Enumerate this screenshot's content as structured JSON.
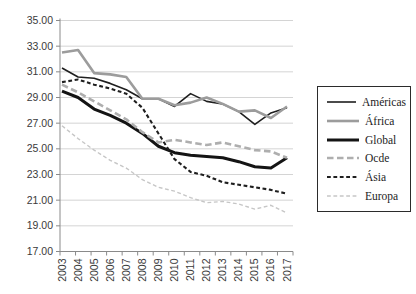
{
  "chart_data": {
    "type": "line",
    "title": "",
    "xlabel": "",
    "ylabel": "",
    "grid": "horizontal",
    "legend_position": "right",
    "ylim": [
      17,
      35
    ],
    "y_tick_step": 2,
    "y_tick_labels": [
      "35.00",
      "33.00",
      "31.00",
      "29.00",
      "27.00",
      "25.00",
      "23.00",
      "21.00",
      "19.00",
      "17.00"
    ],
    "x": [
      "2003",
      "2004",
      "2005",
      "2006",
      "2007",
      "2008",
      "2009",
      "2010",
      "2011",
      "2012",
      "2013",
      "2014",
      "2015",
      "2016",
      "2017"
    ],
    "series": [
      {
        "name": "Américas",
        "color": "#1f1f1f",
        "line": "solid",
        "width": 1.6,
        "values": [
          31.3,
          30.6,
          30.5,
          30.1,
          29.6,
          28.9,
          28.9,
          28.3,
          29.3,
          28.7,
          28.5,
          27.9,
          26.9,
          27.8,
          28.2
        ]
      },
      {
        "name": "África",
        "color": "#9c9c9c",
        "line": "solid",
        "width": 2.6,
        "values": [
          32.5,
          32.7,
          30.9,
          30.8,
          30.6,
          28.9,
          28.9,
          28.4,
          28.6,
          29.0,
          28.5,
          27.9,
          28.0,
          27.4,
          28.3
        ]
      },
      {
        "name": "Global",
        "color": "#141414",
        "line": "solid",
        "width": 3,
        "values": [
          29.5,
          29.0,
          28.1,
          27.6,
          27.0,
          26.2,
          25.2,
          24.7,
          24.5,
          24.4,
          24.3,
          24.0,
          23.6,
          23.5,
          24.3
        ]
      },
      {
        "name": "Ocde",
        "color": "#aeaeae",
        "line": "dashed-long",
        "width": 2.6,
        "values": [
          30.0,
          29.4,
          28.7,
          28.0,
          27.3,
          26.3,
          25.5,
          25.7,
          25.5,
          25.3,
          25.5,
          25.2,
          24.9,
          24.8,
          24.3
        ]
      },
      {
        "name": "Ásia",
        "color": "#1f1f1f",
        "line": "dashed",
        "width": 2.1,
        "values": [
          30.2,
          30.4,
          30.0,
          29.7,
          29.3,
          28.2,
          26.2,
          24.2,
          23.2,
          22.9,
          22.4,
          22.2,
          22.0,
          21.8,
          21.5
        ]
      },
      {
        "name": "Europa",
        "color": "#c6c6c6",
        "line": "dashed",
        "width": 1.4,
        "values": [
          26.8,
          25.8,
          24.9,
          24.1,
          23.5,
          22.6,
          22.0,
          21.7,
          21.2,
          20.8,
          20.9,
          20.7,
          20.3,
          20.6,
          20.0
        ]
      }
    ]
  },
  "colors": {
    "background": "#ffffff",
    "gridline": "#d4d4d4",
    "axis": "#8a8a8a",
    "tick": "#8a8a8a",
    "axis_label": "#3a3a3a",
    "legend_border": "#2b2b2b",
    "legend_text": "#1c1c1c"
  }
}
